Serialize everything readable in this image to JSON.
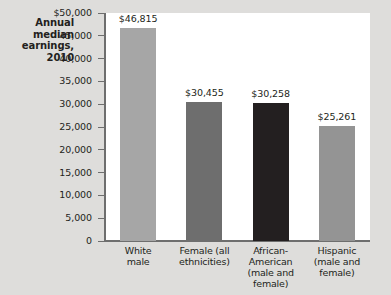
{
  "chart_data": {
    "type": "bar",
    "title_lines": [
      "Annual",
      "median",
      "earnings,",
      "2010"
    ],
    "xlabel": "",
    "ylabel": "",
    "ylim": [
      0,
      50000
    ],
    "grid": false,
    "legend": null,
    "categories": [
      "White male",
      "Female (all ethnicities)",
      "African-American (male and female)",
      "Hispanic (male and female)"
    ],
    "category_lines": [
      [
        "White",
        "male"
      ],
      [
        "Female (all",
        "ethnicities)"
      ],
      [
        "African-",
        "American",
        "(male and",
        "female)"
      ],
      [
        "Hispanic",
        "(male and",
        "female)"
      ]
    ],
    "values": [
      46815,
      30455,
      30258,
      25261
    ],
    "value_labels": [
      "$46,815",
      "$30,455",
      "$30,258",
      "$25,261"
    ],
    "bar_colors": [
      "#a6a6a6",
      "#6e6e6e",
      "#231f20",
      "#949494"
    ],
    "yticks": [
      0,
      5000,
      10000,
      15000,
      20000,
      25000,
      30000,
      35000,
      40000,
      45000,
      50000
    ],
    "ytick_labels": [
      "0",
      "5,000",
      "10,000",
      "15,000",
      "20,000",
      "25,000",
      "30,000",
      "35,000",
      "40,000",
      "45,000",
      "$50,000"
    ]
  },
  "colors": {
    "page_background": "#dedddb",
    "plot_background": "#ffffff",
    "axis": "#6e6e6e",
    "text": "#231f20"
  }
}
